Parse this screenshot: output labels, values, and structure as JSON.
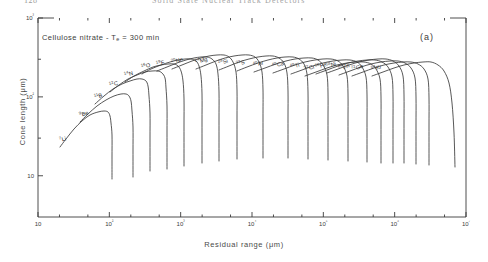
{
  "page": {
    "folio": "128",
    "running_head": "Solid State Nuclear Track Detectors"
  },
  "figure": {
    "panel_label": "(a)",
    "annotation": "Cellulose nitrate - T",
    "annotation_sub": "e",
    "annotation_tail": " = 300 min"
  },
  "chart_data": {
    "type": "line",
    "title": "",
    "annotation": "Cellulose nitrate - Te = 300 min",
    "panel": "(a)",
    "xlabel": "Residual range (μm)",
    "ylabel": "Cone length (μm)",
    "xscale": "log",
    "yscale": "log",
    "xlim": [
      10,
      10000000
    ],
    "ylim": [
      3,
      1000
    ],
    "grid": false,
    "legend": "inline-curve-labels",
    "xticks": [
      10,
      100,
      1000,
      10000,
      100000,
      1000000,
      10000000
    ],
    "xticklabels": [
      "10",
      "10²",
      "10³",
      "10⁴",
      "10⁵",
      "10⁶",
      "10⁷"
    ],
    "yticks": [
      10,
      100,
      1000
    ],
    "yticklabels": [
      "10",
      "10²",
      "10³"
    ],
    "series": [
      {
        "name": "7Li",
        "mass": 7,
        "element": "Li",
        "label_x": 60,
        "label_y": 131,
        "points": [
          [
            60,
            136
          ],
          [
            66,
            128
          ],
          [
            74,
            118
          ],
          [
            82,
            110
          ],
          [
            90,
            104
          ],
          [
            98,
            101
          ],
          [
            104,
            100
          ],
          [
            108,
            101
          ],
          [
            110,
            105
          ],
          [
            111,
            112
          ],
          [
            112,
            124
          ],
          [
            112,
            146
          ],
          [
            112,
            168
          ]
        ]
      },
      {
        "name": "9Be",
        "mass": 9,
        "element": "Be",
        "label_x": 80,
        "label_y": 106,
        "points": [
          [
            80,
            111
          ],
          [
            88,
            103
          ],
          [
            97,
            95
          ],
          [
            106,
            89
          ],
          [
            114,
            85
          ],
          [
            121,
            83
          ],
          [
            126,
            83
          ],
          [
            129,
            85
          ],
          [
            131,
            90
          ],
          [
            132,
            100
          ],
          [
            133,
            116
          ],
          [
            133,
            140
          ],
          [
            133,
            166
          ]
        ]
      },
      {
        "name": "11B",
        "mass": 11,
        "element": "B",
        "label_x": 95,
        "label_y": 88,
        "points": [
          [
            95,
            93
          ],
          [
            104,
            85
          ],
          [
            113,
            78
          ],
          [
            122,
            73
          ],
          [
            130,
            70
          ],
          [
            137,
            68
          ],
          [
            142,
            68
          ],
          [
            146,
            70
          ],
          [
            148,
            75
          ],
          [
            149,
            85
          ],
          [
            150,
            102
          ],
          [
            150,
            128
          ],
          [
            150,
            160
          ]
        ]
      },
      {
        "name": "12C",
        "mass": 12,
        "element": "C",
        "label_x": 110,
        "label_y": 76,
        "points": [
          [
            110,
            81
          ],
          [
            119,
            74
          ],
          [
            128,
            68
          ],
          [
            137,
            64
          ],
          [
            145,
            61
          ],
          [
            152,
            60
          ],
          [
            158,
            60
          ],
          [
            162,
            62
          ],
          [
            165,
            67
          ],
          [
            166,
            77
          ],
          [
            167,
            95
          ],
          [
            167,
            122
          ],
          [
            167,
            158
          ]
        ]
      },
      {
        "name": "14N",
        "mass": 14,
        "element": "N",
        "label_x": 125,
        "label_y": 66,
        "points": [
          [
            125,
            71
          ],
          [
            134,
            65
          ],
          [
            144,
            60
          ],
          [
            153,
            56
          ],
          [
            161,
            54
          ],
          [
            168,
            53
          ],
          [
            174,
            53
          ],
          [
            178,
            55
          ],
          [
            181,
            60
          ],
          [
            183,
            70
          ],
          [
            184,
            88
          ],
          [
            184,
            116
          ],
          [
            184,
            155
          ]
        ]
      },
      {
        "name": "16O",
        "mass": 16,
        "element": "O",
        "label_x": 142,
        "label_y": 58,
        "points": [
          [
            142,
            63
          ],
          [
            151,
            58
          ],
          [
            161,
            54
          ],
          [
            170,
            51
          ],
          [
            178,
            49
          ],
          [
            185,
            48
          ],
          [
            191,
            48
          ],
          [
            196,
            50
          ],
          [
            199,
            55
          ],
          [
            201,
            65
          ],
          [
            202,
            83
          ],
          [
            202,
            112
          ],
          [
            202,
            152
          ]
        ]
      },
      {
        "name": "19F",
        "mass": 19,
        "element": "F",
        "label_x": 157,
        "label_y": 55,
        "points": [
          [
            157,
            60
          ],
          [
            167,
            56
          ],
          [
            177,
            52
          ],
          [
            186,
            49
          ],
          [
            194,
            47
          ],
          [
            201,
            46
          ],
          [
            207,
            46
          ],
          [
            212,
            48
          ],
          [
            216,
            53
          ],
          [
            218,
            63
          ],
          [
            219,
            81
          ],
          [
            219,
            110
          ],
          [
            219,
            150
          ]
        ]
      },
      {
        "name": "20Ne",
        "mass": 20,
        "element": "Ne",
        "label_x": 172,
        "label_y": 53,
        "points": [
          [
            172,
            58
          ],
          [
            182,
            54
          ],
          [
            192,
            50
          ],
          [
            201,
            47
          ],
          [
            209,
            45
          ],
          [
            217,
            44
          ],
          [
            224,
            44
          ],
          [
            229,
            46
          ],
          [
            233,
            51
          ],
          [
            236,
            61
          ],
          [
            237,
            79
          ],
          [
            237,
            108
          ],
          [
            237,
            148
          ]
        ]
      },
      {
        "name": "24Mg",
        "mass": 24,
        "element": "Mg",
        "label_x": 196,
        "label_y": 53,
        "points": [
          [
            196,
            58
          ],
          [
            206,
            54
          ],
          [
            216,
            50
          ],
          [
            225,
            47
          ],
          [
            234,
            45
          ],
          [
            242,
            44
          ],
          [
            249,
            44
          ],
          [
            255,
            46
          ],
          [
            259,
            51
          ],
          [
            262,
            61
          ],
          [
            263,
            79
          ],
          [
            263,
            107
          ],
          [
            263,
            147
          ]
        ]
      },
      {
        "name": "28Si",
        "mass": 28,
        "element": "Si",
        "label_x": 219,
        "label_y": 54,
        "points": [
          [
            219,
            59
          ],
          [
            229,
            55
          ],
          [
            239,
            51
          ],
          [
            249,
            48
          ],
          [
            258,
            46
          ],
          [
            266,
            45
          ],
          [
            273,
            45
          ],
          [
            279,
            47
          ],
          [
            284,
            52
          ],
          [
            287,
            62
          ],
          [
            288,
            80
          ],
          [
            288,
            108
          ],
          [
            288,
            147
          ]
        ]
      },
      {
        "name": "32S",
        "mass": 32,
        "element": "S",
        "label_x": 237,
        "label_y": 55,
        "points": [
          [
            237,
            60
          ],
          [
            247,
            56
          ],
          [
            258,
            52
          ],
          [
            268,
            49
          ],
          [
            277,
            47
          ],
          [
            285,
            46
          ],
          [
            293,
            46
          ],
          [
            299,
            48
          ],
          [
            304,
            53
          ],
          [
            307,
            63
          ],
          [
            308,
            81
          ],
          [
            308,
            109
          ],
          [
            308,
            148
          ]
        ]
      },
      {
        "name": "40Ar",
        "mass": 40,
        "element": "Ar",
        "label_x": 254,
        "label_y": 56,
        "points": [
          [
            254,
            61
          ],
          [
            265,
            57
          ],
          [
            276,
            53
          ],
          [
            286,
            50
          ],
          [
            295,
            48
          ],
          [
            304,
            47
          ],
          [
            312,
            47
          ],
          [
            318,
            49
          ],
          [
            323,
            54
          ],
          [
            327,
            64
          ],
          [
            328,
            82
          ],
          [
            328,
            110
          ],
          [
            328,
            149
          ]
        ]
      },
      {
        "name": "40Ca",
        "mass": 40,
        "element": "Ca",
        "label_x": 273,
        "label_y": 57,
        "points": [
          [
            273,
            62
          ],
          [
            284,
            58
          ],
          [
            295,
            54
          ],
          [
            305,
            51
          ],
          [
            315,
            49
          ],
          [
            323,
            48
          ],
          [
            331,
            48
          ],
          [
            338,
            50
          ],
          [
            343,
            55
          ],
          [
            347,
            65
          ],
          [
            348,
            83
          ],
          [
            348,
            111
          ],
          [
            348,
            150
          ]
        ]
      },
      {
        "name": "48Ti",
        "mass": 48,
        "element": "Ti",
        "label_x": 291,
        "label_y": 58,
        "points": [
          [
            291,
            63
          ],
          [
            302,
            59
          ],
          [
            313,
            55
          ],
          [
            323,
            52
          ],
          [
            333,
            50
          ],
          [
            342,
            49
          ],
          [
            350,
            49
          ],
          [
            357,
            51
          ],
          [
            362,
            56
          ],
          [
            366,
            66
          ],
          [
            367,
            84
          ],
          [
            367,
            112
          ],
          [
            367,
            151
          ]
        ]
      },
      {
        "name": "52Cr",
        "mass": 52,
        "element": "Cr",
        "label_x": 305,
        "label_y": 60,
        "points": [
          [
            305,
            65
          ],
          [
            316,
            61
          ],
          [
            327,
            57
          ],
          [
            337,
            54
          ],
          [
            347,
            52
          ],
          [
            356,
            51
          ],
          [
            364,
            51
          ],
          [
            371,
            53
          ],
          [
            376,
            58
          ],
          [
            380,
            68
          ],
          [
            381,
            86
          ],
          [
            381,
            114
          ],
          [
            381,
            152
          ]
        ]
      },
      {
        "name": "56Fe",
        "mass": 56,
        "element": "Fe",
        "label_x": 316,
        "label_y": 58,
        "points": [
          [
            316,
            63
          ],
          [
            327,
            59
          ],
          [
            338,
            55
          ],
          [
            348,
            52
          ],
          [
            358,
            50
          ],
          [
            367,
            49
          ],
          [
            375,
            49
          ],
          [
            382,
            51
          ],
          [
            388,
            56
          ],
          [
            392,
            66
          ],
          [
            393,
            84
          ],
          [
            393,
            113
          ],
          [
            393,
            152
          ]
        ]
      },
      {
        "name": "58Ni",
        "mass": 58,
        "element": "Ni",
        "label_x": 327,
        "label_y": 57,
        "points": [
          [
            327,
            62
          ],
          [
            338,
            58
          ],
          [
            349,
            54
          ],
          [
            359,
            51
          ],
          [
            369,
            49
          ],
          [
            378,
            48
          ],
          [
            386,
            48
          ],
          [
            393,
            50
          ],
          [
            399,
            55
          ],
          [
            403,
            65
          ],
          [
            404,
            84
          ],
          [
            404,
            113
          ],
          [
            404,
            152
          ]
        ]
      },
      {
        "name": "64Zn",
        "mass": 64,
        "element": "Zn",
        "label_x": 339,
        "label_y": 59,
        "points": [
          [
            339,
            64
          ],
          [
            350,
            60
          ],
          [
            361,
            56
          ],
          [
            371,
            53
          ],
          [
            381,
            51
          ],
          [
            390,
            50
          ],
          [
            398,
            50
          ],
          [
            405,
            52
          ],
          [
            411,
            57
          ],
          [
            415,
            67
          ],
          [
            416,
            86
          ],
          [
            416,
            115
          ],
          [
            416,
            153
          ]
        ]
      },
      {
        "name": "72Ge",
        "mass": 72,
        "element": "Ge",
        "label_x": 352,
        "label_y": 60,
        "points": [
          [
            352,
            65
          ],
          [
            363,
            61
          ],
          [
            374,
            57
          ],
          [
            384,
            54
          ],
          [
            394,
            52
          ],
          [
            403,
            51
          ],
          [
            411,
            51
          ],
          [
            418,
            53
          ],
          [
            424,
            58
          ],
          [
            428,
            68
          ],
          [
            429,
            87
          ],
          [
            429,
            116
          ],
          [
            429,
            154
          ]
        ]
      },
      {
        "name": "84Kr",
        "mass": 84,
        "element": "Kr",
        "label_x": 372,
        "label_y": 60,
        "points": [
          [
            372,
            65
          ],
          [
            383,
            61
          ],
          [
            394,
            57
          ],
          [
            404,
            54
          ],
          [
            414,
            52
          ],
          [
            423,
            51
          ],
          [
            431,
            51
          ],
          [
            438,
            54
          ],
          [
            444,
            60
          ],
          [
            449,
            72
          ],
          [
            452,
            92
          ],
          [
            454,
            122
          ],
          [
            455,
            156
          ]
        ]
      }
    ]
  }
}
